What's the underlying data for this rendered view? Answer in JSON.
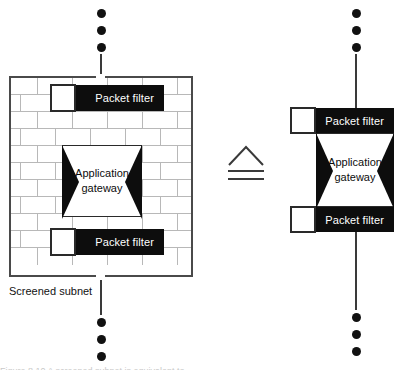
{
  "figure": {
    "type": "network-security-diagram",
    "equivalence_symbol": "corresponds-to",
    "cut_caption": "Figure 8.10 A screened subnet is equivalent to ...",
    "colors": {
      "ink": "#0d0d0d",
      "line": "#3a3a3a",
      "brick_mortar": "#b8b8b8",
      "paper": "#ffffff"
    }
  },
  "left_side": {
    "name": "screened-subnet",
    "caption": "Screened subnet",
    "top_packet_filter": {
      "label": "Packet filter"
    },
    "application_gateway": {
      "label_line1": "Application",
      "label_line2": "gateway"
    },
    "bottom_packet_filter": {
      "label": "Packet filter"
    },
    "ellipsis_top": [
      "dot",
      "dot",
      "dot"
    ],
    "ellipsis_bottom": [
      "dot",
      "dot",
      "dot"
    ]
  },
  "right_side": {
    "name": "equivalent-stack",
    "top_packet_filter": {
      "label": "Packet filter"
    },
    "application_gateway": {
      "label_line1": "Application",
      "label_line2": "gateway"
    },
    "bottom_packet_filter": {
      "label": "Packet filter"
    },
    "ellipsis_top": [
      "dot",
      "dot",
      "dot"
    ],
    "ellipsis_bottom": [
      "dot",
      "dot",
      "dot"
    ]
  }
}
